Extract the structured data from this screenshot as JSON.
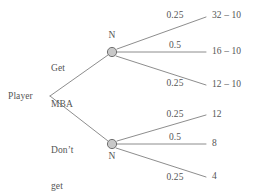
{
  "diagram": {
    "type": "decision-tree",
    "title_text": "",
    "colors": {
      "line": "#808080",
      "text": "#555555",
      "node_fill": "#c8c8c8",
      "node_stroke": "#707070",
      "background": "#ffffff"
    },
    "root": {
      "label": "Player",
      "name": "player-decision-node"
    },
    "decisions": [
      {
        "id": "get-mba",
        "label_lines": [
          "Get",
          "MBA"
        ],
        "chance_node_letter": "N"
      },
      {
        "id": "dont-get-mba",
        "label_lines": [
          "Don’t",
          "get",
          "MBA"
        ],
        "chance_node_letter": "N"
      }
    ],
    "branches_upper": [
      {
        "probability": "0.25",
        "payoff": "32 – 10"
      },
      {
        "probability": "0.5",
        "payoff": "16 – 10"
      },
      {
        "probability": "0.25",
        "payoff": "12 – 10"
      }
    ],
    "branches_lower": [
      {
        "probability": "0.25",
        "payoff": "12"
      },
      {
        "probability": "0.5",
        "payoff": "8"
      },
      {
        "probability": "0.25",
        "payoff": "4"
      }
    ]
  }
}
